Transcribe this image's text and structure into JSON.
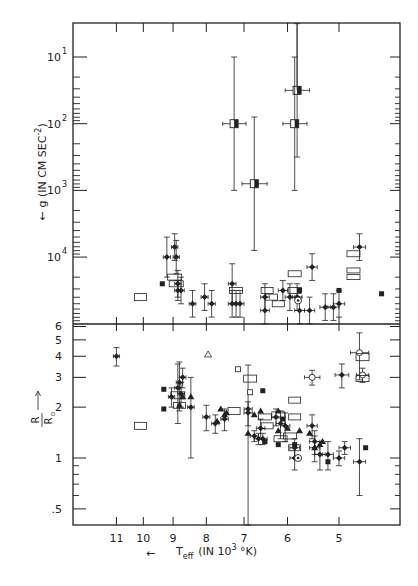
{
  "chart_data": {
    "type": "scatter",
    "title": "",
    "xlabel": "← T_eff (IN 10^3 °K)",
    "x_label_parts": {
      "arrow": "←",
      "t": "T",
      "sub": "eff",
      "rest1": "(IN 10",
      "sup": "3",
      "rest2": " °K)"
    },
    "x_scale": "log-reversed",
    "x_ticks": [
      11,
      10,
      9,
      8,
      7,
      6,
      5
    ],
    "x_tick_labels": [
      "11",
      "10",
      "9",
      "8",
      "7",
      "6",
      "5"
    ],
    "panels": [
      {
        "id": "top",
        "ylabel": "← g (IN CM SEC^-2)",
        "ylabel_parts": {
          "arrow": "←",
          "text": "g (IN CM SEC",
          "sup": "-2",
          "close": ")"
        },
        "y_scale": "log-reversed",
        "y_ticks_exponent": [
          1,
          2,
          3,
          4
        ],
        "y_tick_labels": [
          {
            "base": "10",
            "exp": "1"
          },
          {
            "base": "10",
            "exp": "2"
          },
          {
            "base": "10",
            "exp": "3"
          },
          {
            "base": "10",
            "exp": "4"
          }
        ],
        "series": [
          {
            "name": "half-filled squares (binaries)",
            "marker": "halfsquare",
            "points": [
              {
                "T": 7.25,
                "logg": 2.0,
                "yerr": 1.0,
                "xerr": 0.3
              },
              {
                "T": 6.75,
                "logg": 2.9,
                "yerr": 1.0,
                "xerr": 0.3
              },
              {
                "T": 5.8,
                "logg": 1.5,
                "yerr": 1.0,
                "xerr": 0.25
              },
              {
                "T": 5.85,
                "logg": 2.0,
                "yerr": 1.0,
                "xerr": 0.25
              }
            ]
          },
          {
            "name": "filled diamonds with error bars",
            "marker": "diamond",
            "points": [
              {
                "T": 9.2,
                "logg": 4.0,
                "yerr": 0.3,
                "xerr": 0.12
              },
              {
                "T": 8.95,
                "logg": 3.85,
                "yerr": 0.2,
                "xerr": 0.1
              },
              {
                "T": 8.9,
                "logg": 4.0,
                "yerr": 0.25,
                "xerr": 0.1
              },
              {
                "T": 8.85,
                "logg": 4.4,
                "yerr": 0.2,
                "xerr": 0.1
              },
              {
                "T": 8.85,
                "logg": 4.5,
                "yerr": 0.15,
                "xerr": 0.1
              },
              {
                "T": 8.75,
                "logg": 4.5,
                "yerr": 0.2,
                "xerr": 0.1
              },
              {
                "T": 8.4,
                "logg": 4.7,
                "yerr": 0.2,
                "xerr": 0.1
              },
              {
                "T": 8.05,
                "logg": 4.6,
                "yerr": 0.2,
                "xerr": 0.1
              },
              {
                "T": 7.85,
                "logg": 4.7,
                "yerr": 0.2,
                "xerr": 0.1
              },
              {
                "T": 7.3,
                "logg": 4.4,
                "yerr": 0.3,
                "xerr": 0.1
              },
              {
                "T": 7.3,
                "logg": 4.7,
                "yerr": 0.2,
                "xerr": 0.1
              },
              {
                "T": 7.2,
                "logg": 4.7,
                "yerr": 0.2,
                "xerr": 0.1
              },
              {
                "T": 7.1,
                "logg": 4.7,
                "yerr": 0.2,
                "xerr": 0.1
              },
              {
                "T": 6.5,
                "logg": 4.6,
                "yerr": 0.2,
                "xerr": 0.1
              },
              {
                "T": 6.5,
                "logg": 4.8,
                "yerr": 0.2,
                "xerr": 0.1
              },
              {
                "T": 6.1,
                "logg": 4.5,
                "yerr": 0.15,
                "xerr": 0.1
              },
              {
                "T": 5.95,
                "logg": 4.6,
                "yerr": 0.2,
                "xerr": 0.1
              },
              {
                "T": 5.8,
                "logg": 4.6,
                "yerr": 0.2,
                "xerr": 0.1
              },
              {
                "T": 5.75,
                "logg": 4.8,
                "yerr": 0.2,
                "xerr": 0.1
              },
              {
                "T": 5.55,
                "logg": 4.8,
                "yerr": 0.2,
                "xerr": 0.1
              },
              {
                "T": 5.5,
                "logg": 4.15,
                "yerr": 0.2,
                "xerr": 0.1
              },
              {
                "T": 5.25,
                "logg": 4.75,
                "yerr": 0.2,
                "xerr": 0.1
              },
              {
                "T": 5.1,
                "logg": 4.75,
                "yerr": 0.2,
                "xerr": 0.1
              },
              {
                "T": 5.0,
                "logg": 4.7,
                "yerr": 0.2,
                "xerr": 0.1
              },
              {
                "T": 4.65,
                "logg": 3.85,
                "yerr": 0.2,
                "xerr": 0.1
              }
            ]
          },
          {
            "name": "filled squares",
            "marker": "square",
            "points": [
              {
                "T": 9.35,
                "logg": 4.4
              },
              {
                "T": 5.75,
                "logg": 4.5
              },
              {
                "T": 5.0,
                "logg": 4.5
              },
              {
                "T": 4.3,
                "logg": 4.55
              }
            ]
          },
          {
            "name": "sun",
            "marker": "sun",
            "points": [
              {
                "T": 5.78,
                "logg": 4.65
              }
            ]
          },
          {
            "name": "open rectangles (ranges)",
            "marker": "rect",
            "points": [
              {
                "T": 10.1,
                "logg": 4.6,
                "w": 12,
                "h": 7
              },
              {
                "T": 8.95,
                "logg": 4.3,
                "w": 14,
                "h": 6
              },
              {
                "T": 8.9,
                "logg": 4.4,
                "w": 14,
                "h": 6
              },
              {
                "T": 7.2,
                "logg": 4.5,
                "w": 13,
                "h": 6
              },
              {
                "T": 6.45,
                "logg": 4.5,
                "w": 12,
                "h": 6
              },
              {
                "T": 6.35,
                "logg": 4.6,
                "w": 12,
                "h": 6
              },
              {
                "T": 6.2,
                "logg": 4.7,
                "w": 12,
                "h": 6
              },
              {
                "T": 5.85,
                "logg": 4.25,
                "w": 13,
                "h": 6
              },
              {
                "T": 5.85,
                "logg": 4.5,
                "w": 13,
                "h": 6
              },
              {
                "T": 4.75,
                "logg": 3.95,
                "w": 13,
                "h": 6
              },
              {
                "T": 4.75,
                "logg": 4.2,
                "w": 13,
                "h": 5
              },
              {
                "T": 4.75,
                "logg": 4.3,
                "w": 13,
                "h": 5
              }
            ]
          }
        ]
      },
      {
        "id": "bottom",
        "ylabel": "R / R⊙ →",
        "ylabel_parts": {
          "num": "R",
          "den": "R",
          "sub": "⊙",
          "arrow": "→"
        },
        "y_scale": "log",
        "y_ticks": [
          0.5,
          1,
          2,
          3,
          4,
          5,
          6
        ],
        "y_tick_labels": [
          ".5",
          "1",
          "2",
          "3",
          "4",
          "5",
          "6"
        ],
        "series": [
          {
            "name": "filled diamonds with error bars",
            "marker": "diamond",
            "points": [
              {
                "T": 11.0,
                "R": 4.0,
                "yerr": 0.5,
                "xerr": 0.12
              },
              {
                "T": 9.05,
                "R": 2.3,
                "yerr": 0.3,
                "xerr": 0.1
              },
              {
                "T": 8.85,
                "R": 2.6,
                "yerr": 1.0,
                "xerr": 0.1
              },
              {
                "T": 8.8,
                "R": 2.8,
                "yerr": 0.9,
                "xerr": 0.1
              },
              {
                "T": 8.75,
                "R": 2.4,
                "yerr": 0.4,
                "xerr": 0.1
              },
              {
                "T": 8.7,
                "R": 3.0,
                "yerr": 0.4,
                "xerr": 0.1
              },
              {
                "T": 8.45,
                "R": 2.0,
                "yerr": 1.0,
                "xerr": 0.1
              },
              {
                "T": 8.0,
                "R": 1.75,
                "yerr": 0.3,
                "xerr": 0.1
              },
              {
                "T": 7.75,
                "R": 1.6,
                "yerr": 0.2,
                "xerr": 0.1
              },
              {
                "T": 7.5,
                "R": 1.7,
                "yerr": 0.25,
                "xerr": 0.1
              },
              {
                "T": 6.9,
                "R": 1.95,
                "yerr": 1.6,
                "xerr": 0.1
              },
              {
                "T": 6.9,
                "R": 1.85,
                "yerr": 0.3,
                "xerr": 0.1
              },
              {
                "T": 6.75,
                "R": 1.35,
                "yerr": 0.1,
                "xerr": 0.1
              },
              {
                "T": 6.65,
                "R": 1.3,
                "yerr": 0.1,
                "xerr": 0.1
              },
              {
                "T": 6.55,
                "R": 1.3,
                "yerr": 0.1,
                "xerr": 0.1
              },
              {
                "T": 6.6,
                "R": 1.5,
                "yerr": 0.2,
                "xerr": 0.1
              },
              {
                "T": 6.25,
                "R": 1.75,
                "yerr": 0.2,
                "xerr": 0.1
              },
              {
                "T": 6.15,
                "R": 1.6,
                "yerr": 0.3,
                "xerr": 0.1
              },
              {
                "T": 6.05,
                "R": 1.55,
                "yerr": 0.3,
                "xerr": 0.1
              },
              {
                "T": 5.85,
                "R": 1.0,
                "yerr": 0.15,
                "xerr": 0.1
              },
              {
                "T": 5.85,
                "R": 1.15,
                "yerr": 0.15,
                "xerr": 0.1
              },
              {
                "T": 5.5,
                "R": 1.55,
                "yerr": 0.25,
                "xerr": 0.1
              },
              {
                "T": 5.45,
                "R": 1.25,
                "yerr": 0.2,
                "xerr": 0.1
              },
              {
                "T": 5.45,
                "R": 1.15,
                "yerr": 0.2,
                "xerr": 0.1
              },
              {
                "T": 5.35,
                "R": 1.05,
                "yerr": 0.2,
                "xerr": 0.1
              },
              {
                "T": 5.2,
                "R": 1.05,
                "yerr": 0.2,
                "xerr": 0.1
              },
              {
                "T": 5.0,
                "R": 1.0,
                "yerr": 0.1,
                "xerr": 0.1
              },
              {
                "T": 4.9,
                "R": 1.15,
                "yerr": 0.1,
                "xerr": 0.1
              },
              {
                "T": 4.65,
                "R": 0.95,
                "yerr": 0.35,
                "xerr": 0.1
              },
              {
                "T": 4.95,
                "R": 3.1,
                "yerr": 0.5,
                "xerr": 0.12
              }
            ]
          },
          {
            "name": "filled triangles",
            "marker": "triangle",
            "points": [
              {
                "T": 8.45,
                "R": 2.3
              },
              {
                "T": 8.8,
                "R": 2.05
              },
              {
                "T": 8.7,
                "R": 2.3
              },
              {
                "T": 7.5,
                "R": 1.8
              },
              {
                "T": 7.45,
                "R": 1.85
              },
              {
                "T": 7.6,
                "R": 1.95
              },
              {
                "T": 6.75,
                "R": 1.8
              },
              {
                "T": 6.6,
                "R": 1.9
              },
              {
                "T": 6.2,
                "R": 1.9
              },
              {
                "T": 6.2,
                "R": 1.45
              },
              {
                "T": 6.0,
                "R": 1.5
              },
              {
                "T": 5.75,
                "R": 1.45
              },
              {
                "T": 5.55,
                "R": 1.4
              },
              {
                "T": 5.45,
                "R": 1.15
              },
              {
                "T": 5.35,
                "R": 1.2
              },
              {
                "T": 5.3,
                "R": 1.25
              },
              {
                "T": 7.7,
                "R": 1.65
              },
              {
                "T": 6.9,
                "R": 1.4
              }
            ]
          },
          {
            "name": "filled squares",
            "marker": "square",
            "points": [
              {
                "T": 9.3,
                "R": 2.55
              },
              {
                "T": 9.3,
                "R": 1.95
              },
              {
                "T": 6.55,
                "R": 2.5
              },
              {
                "T": 6.5,
                "R": 1.25
              },
              {
                "T": 6.2,
                "R": 1.2
              },
              {
                "T": 6.1,
                "R": 1.7
              },
              {
                "T": 5.85,
                "R": 1.2
              },
              {
                "T": 5.2,
                "R": 0.95
              },
              {
                "T": 4.55,
                "R": 1.15
              }
            ]
          },
          {
            "name": "open triangle",
            "marker": "opentriangle",
            "points": [
              {
                "T": 7.95,
                "R": 4.1
              }
            ]
          },
          {
            "name": "open small squares",
            "marker": "opensquare",
            "points": [
              {
                "T": 7.15,
                "R": 3.35
              },
              {
                "T": 6.85,
                "R": 2.45
              }
            ]
          },
          {
            "name": "open circles with error bars",
            "marker": "opencircle",
            "points": [
              {
                "T": 5.5,
                "R": 3.0,
                "yerr": 0.3,
                "xerr": 0.15
              },
              {
                "T": 4.65,
                "R": 4.2,
                "yerr": 1.3,
                "xerr": 0.15
              },
              {
                "T": 4.6,
                "R": 3.1,
                "yerr": 0.3,
                "xerr": 0.1
              }
            ]
          },
          {
            "name": "sun",
            "marker": "sun",
            "points": [
              {
                "T": 5.78,
                "R": 1.0
              }
            ]
          },
          {
            "name": "open rectangles (ranges)",
            "marker": "rect",
            "points": [
              {
                "T": 10.1,
                "R": 1.55,
                "w": 12,
                "h": 7
              },
              {
                "T": 8.85,
                "R": 2.35,
                "w": 14,
                "h": 7
              },
              {
                "T": 8.8,
                "R": 2.05,
                "w": 12,
                "h": 6
              },
              {
                "T": 7.25,
                "R": 1.9,
                "w": 12,
                "h": 7
              },
              {
                "T": 6.85,
                "R": 2.95,
                "w": 13,
                "h": 7
              },
              {
                "T": 6.5,
                "R": 1.75,
                "w": 13,
                "h": 6
              },
              {
                "T": 6.45,
                "R": 1.55,
                "w": 12,
                "h": 6
              },
              {
                "T": 6.2,
                "R": 1.8,
                "w": 13,
                "h": 6
              },
              {
                "T": 6.15,
                "R": 1.3,
                "w": 13,
                "h": 6
              },
              {
                "T": 5.95,
                "R": 1.35,
                "w": 13,
                "h": 6
              },
              {
                "T": 5.85,
                "R": 2.2,
                "w": 12,
                "h": 6
              },
              {
                "T": 5.85,
                "R": 1.75,
                "w": 12,
                "h": 6
              },
              {
                "T": 5.85,
                "R": 1.15,
                "w": 12,
                "h": 6
              },
              {
                "T": 4.6,
                "R": 3.95,
                "w": 13,
                "h": 7
              },
              {
                "T": 4.6,
                "R": 2.95,
                "w": 13,
                "h": 6
              }
            ]
          }
        ]
      }
    ],
    "legend": "none",
    "grid": false
  }
}
